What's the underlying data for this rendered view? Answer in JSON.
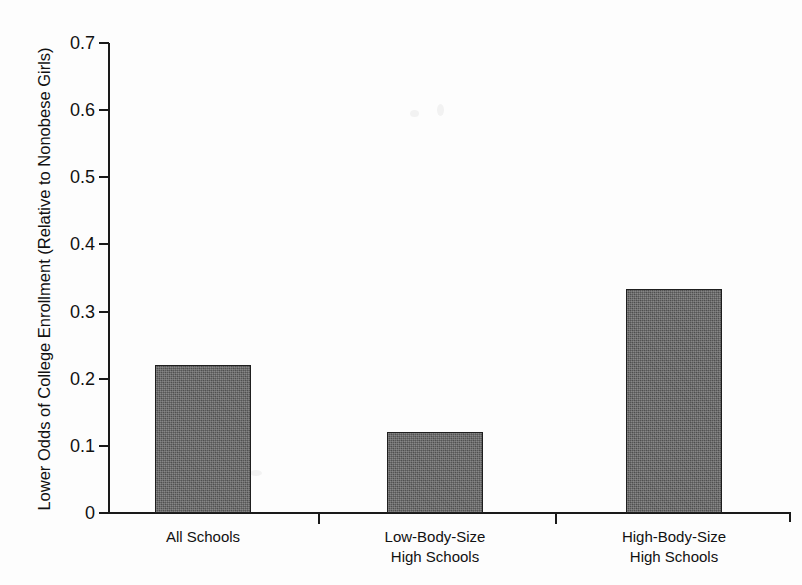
{
  "chart_data": {
    "type": "bar",
    "title": "",
    "xlabel": "",
    "ylabel": "Lower Odds of College Enrollment (Relative to Nonobese Girls)",
    "categories": [
      "All Schools",
      "Low-Body-Size\nHigh Schools",
      "High-Body-Size\nHigh Schools"
    ],
    "values": [
      0.22,
      0.12,
      0.333
    ],
    "ylim": [
      0,
      0.7
    ],
    "ytick_labels": [
      "0",
      "0.1",
      "0.2",
      "0.3",
      "0.4",
      "0.5",
      "0.6",
      "0.7"
    ],
    "ytick_values": [
      0,
      0.1,
      0.2,
      0.3,
      0.4,
      0.5,
      0.6,
      0.7
    ],
    "grid": false,
    "legend": false,
    "bar_color": "#565656",
    "bar_edge_color": "#1f1f1f",
    "axis_color": "#1a1a1a",
    "background": "#fdfdfd"
  }
}
